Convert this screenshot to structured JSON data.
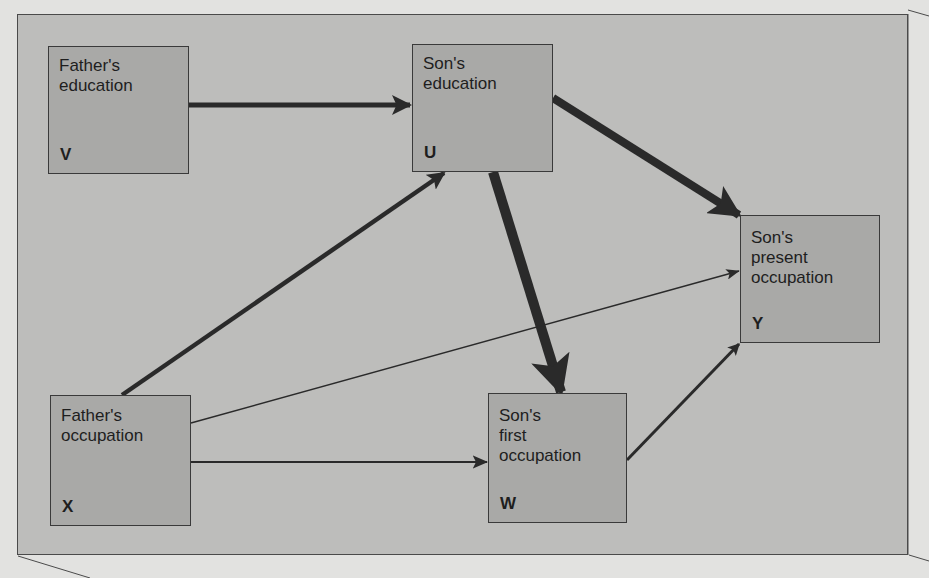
{
  "diagram": {
    "type": "path-diagram",
    "nodes": [
      {
        "id": "V",
        "label": "Father's\neducation",
        "symbol": "V"
      },
      {
        "id": "U",
        "label": "Son's\neducation",
        "symbol": "U"
      },
      {
        "id": "Y",
        "label": "Son's\npresent\noccupation",
        "symbol": "Y"
      },
      {
        "id": "X",
        "label": "Father's\noccupation",
        "symbol": "X"
      },
      {
        "id": "W",
        "label": "Son's\nfirst\noccupation",
        "symbol": "W"
      }
    ],
    "edges": [
      {
        "from": "V",
        "to": "U",
        "weight": "medium"
      },
      {
        "from": "X",
        "to": "U",
        "weight": "medium"
      },
      {
        "from": "U",
        "to": "W",
        "weight": "heavy"
      },
      {
        "from": "U",
        "to": "Y",
        "weight": "heavy"
      },
      {
        "from": "X",
        "to": "Y",
        "weight": "light"
      },
      {
        "from": "X",
        "to": "W",
        "weight": "light"
      },
      {
        "from": "W",
        "to": "Y",
        "weight": "medium-light"
      }
    ],
    "colors": {
      "page": "#e2e2e0",
      "panel": "#bdbdbb",
      "node_fill": "#a9a9a7",
      "ink": "#2a2a2a"
    }
  }
}
